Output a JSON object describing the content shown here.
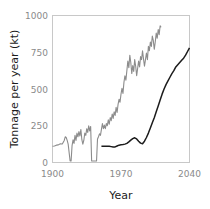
{
  "chart_data": {
    "type": "line",
    "title": "",
    "xlabel": "Year",
    "ylabel": "Tonnage per year (kt)",
    "xlim": [
      1900,
      2040
    ],
    "ylim": [
      0,
      1000
    ],
    "xticks": [
      1900,
      1970,
      2040
    ],
    "xticklabels": [
      "1900",
      "1970",
      "2040"
    ],
    "yticks": [
      0,
      250,
      500,
      750,
      1000
    ],
    "yticklabels": [
      "0",
      "250",
      "500",
      "750",
      "1000"
    ],
    "grid": false,
    "legend": "none",
    "series": [
      {
        "name": "historical-grey",
        "color": "#8c8c8c",
        "width": 1.1,
        "x": [
          1900,
          1902,
          1904,
          1906,
          1908,
          1910,
          1912,
          1913,
          1914,
          1915,
          1916,
          1918,
          1919,
          1920,
          1921,
          1922,
          1923,
          1924,
          1925,
          1926,
          1927,
          1928,
          1929,
          1930,
          1931,
          1932,
          1933,
          1934,
          1935,
          1936,
          1937,
          1938,
          1939,
          1940,
          1941,
          1942,
          1943,
          1944,
          1945,
          1946,
          1947,
          1948,
          1949,
          1950,
          1951,
          1952,
          1953,
          1954,
          1955,
          1956,
          1957,
          1958,
          1959,
          1960,
          1961,
          1962,
          1963,
          1964,
          1965,
          1966,
          1967,
          1968,
          1969,
          1970,
          1971,
          1972,
          1973,
          1974,
          1975,
          1976,
          1977,
          1978,
          1979,
          1980,
          1981,
          1982,
          1983,
          1984,
          1985,
          1986,
          1987,
          1988,
          1989,
          1990,
          1991,
          1992,
          1993,
          1994,
          1995,
          1996,
          1997,
          1998,
          1999,
          2000,
          2001,
          2002,
          2003,
          2004,
          2005,
          2006,
          2007,
          2008,
          2009,
          2010,
          2011
        ],
        "y": [
          110,
          112,
          118,
          120,
          128,
          126,
          150,
          175,
          170,
          150,
          125,
          10,
          10,
          115,
          155,
          130,
          185,
          150,
          200,
          175,
          210,
          180,
          225,
          155,
          125,
          150,
          200,
          185,
          230,
          205,
          250,
          215,
          245,
          10,
          10,
          10,
          10,
          10,
          10,
          160,
          175,
          195,
          185,
          225,
          265,
          230,
          255,
          230,
          265,
          250,
          290,
          260,
          305,
          285,
          330,
          300,
          345,
          320,
          375,
          340,
          395,
          430,
          410,
          465,
          505,
          470,
          545,
          590,
          560,
          625,
          690,
          645,
          730,
          680,
          605,
          660,
          620,
          700,
          655,
          590,
          640,
          690,
          650,
          720,
          700,
          760,
          705,
          655,
          700,
          745,
          700,
          790,
          760,
          820,
          790,
          860,
          830,
          770,
          820,
          880,
          845,
          905,
          870,
          930,
          920
        ]
      },
      {
        "name": "projection-black",
        "color": "#1c1c1c",
        "width": 1.5,
        "x": [
          1950,
          1952,
          1954,
          1956,
          1958,
          1960,
          1962,
          1964,
          1966,
          1968,
          1970,
          1972,
          1974,
          1976,
          1978,
          1980,
          1982,
          1984,
          1986,
          1988,
          1990,
          1992,
          1994,
          1996,
          1998,
          2000,
          2002,
          2004,
          2006,
          2008,
          2010,
          2012,
          2014,
          2016,
          2018,
          2020,
          2022,
          2024,
          2026,
          2028,
          2030,
          2032,
          2034,
          2036,
          2038,
          2040
        ],
        "y": [
          110,
          110,
          110,
          110,
          110,
          108,
          105,
          106,
          112,
          118,
          120,
          122,
          125,
          130,
          140,
          152,
          162,
          168,
          160,
          145,
          132,
          128,
          145,
          170,
          200,
          235,
          270,
          305,
          345,
          385,
          425,
          465,
          500,
          530,
          555,
          580,
          605,
          625,
          650,
          665,
          680,
          695,
          710,
          730,
          755,
          780
        ]
      }
    ]
  },
  "axes": {
    "ylabel": "Tonnage per year (kt)",
    "xlabel": "Year",
    "ytick_0": "0",
    "ytick_250": "250",
    "ytick_500": "500",
    "ytick_750": "750",
    "ytick_1000": "1000",
    "xtick_1900": "1900",
    "xtick_1970": "1970",
    "xtick_2040": "2040"
  }
}
